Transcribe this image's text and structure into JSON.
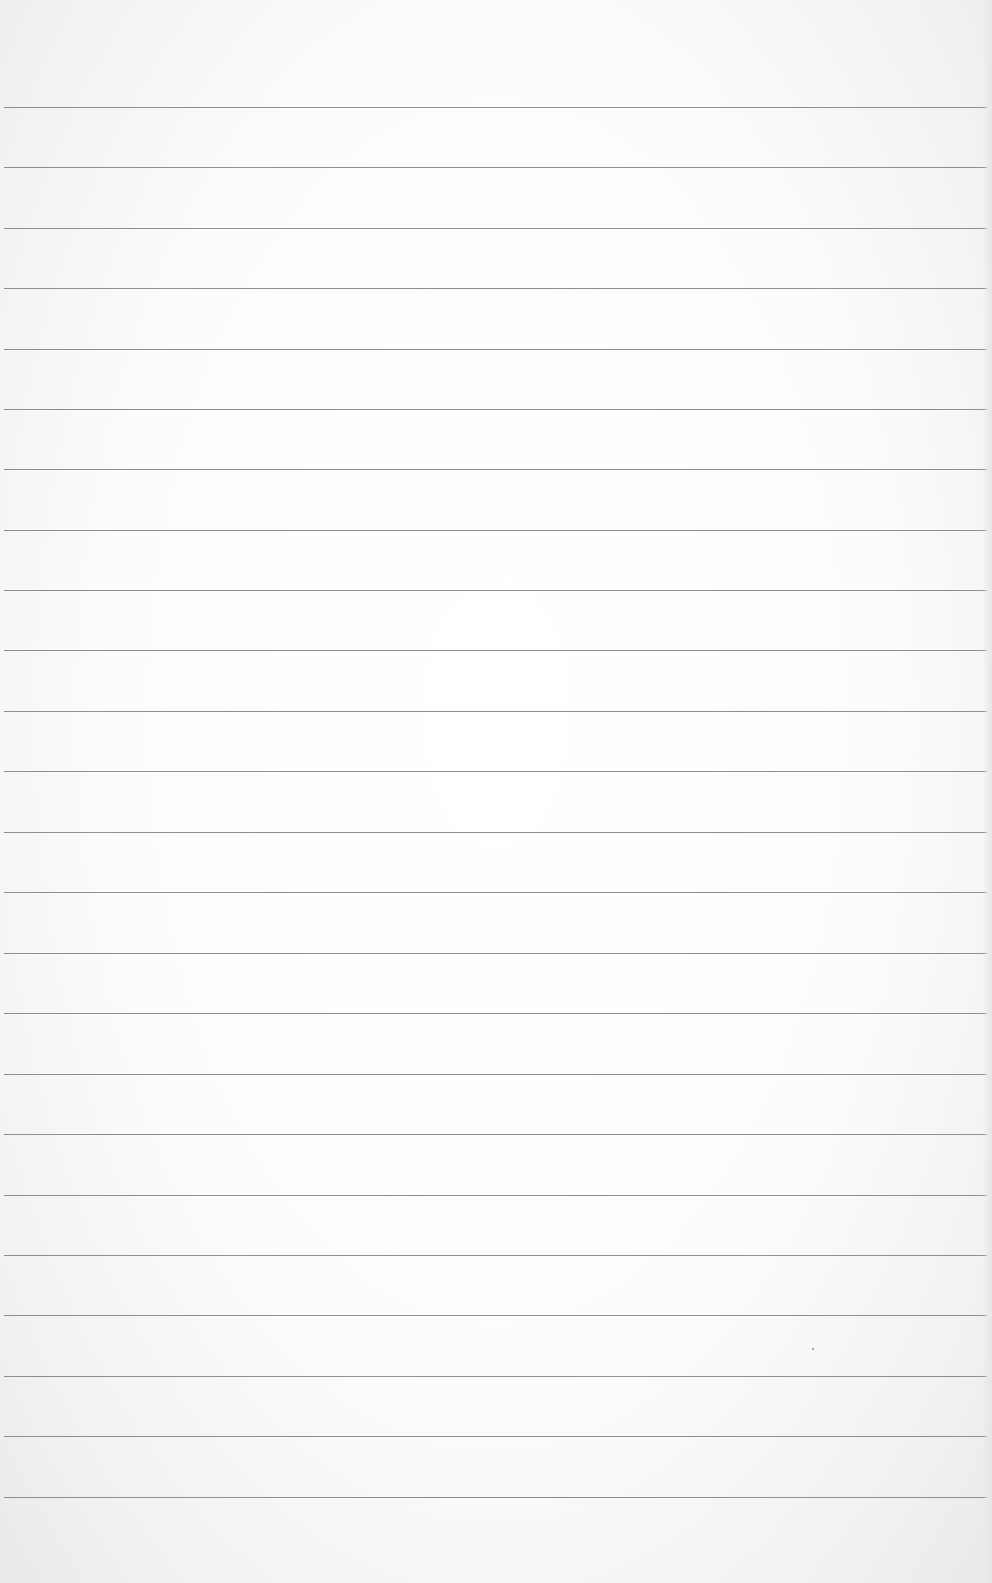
{
  "page": {
    "type": "ruled-notebook-paper",
    "line_color": "#7d7d7d",
    "paper_color": "#ffffff",
    "line_count": 24,
    "line_positions_y": [
      107,
      167,
      228,
      288,
      349,
      409,
      469,
      530,
      590,
      650,
      711,
      771,
      832,
      892,
      953,
      1013,
      1074,
      1134,
      1195,
      1255,
      1315,
      1376,
      1436,
      1497
    ],
    "text_lines": []
  }
}
